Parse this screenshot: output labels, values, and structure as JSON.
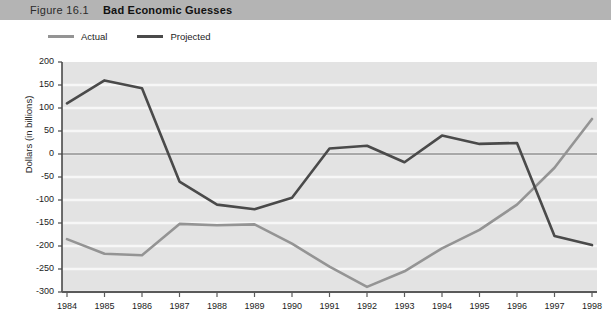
{
  "header": {
    "figure_number": "Figure 16.1",
    "title": "Bad Economic Guesses"
  },
  "legend": {
    "position": "top-left",
    "items": [
      {
        "label": "Actual",
        "color": "#949494",
        "icon": "line-swatch"
      },
      {
        "label": "Projected",
        "color": "#4a4a4a",
        "icon": "line-swatch"
      }
    ]
  },
  "chart_data": {
    "type": "line",
    "title": "Bad Economic Guesses",
    "xlabel": "",
    "ylabel": "Dollars (in billions)",
    "x": [
      1984,
      1985,
      1986,
      1987,
      1988,
      1989,
      1990,
      1991,
      1992,
      1993,
      1994,
      1995,
      1996,
      1997,
      1998
    ],
    "xticklabels": [
      "1984",
      "1985",
      "1986",
      "1987",
      "1988",
      "1989",
      "1990",
      "1991",
      "1992",
      "1993",
      "1994",
      "1995",
      "1996",
      "1997",
      "1998"
    ],
    "yticks": [
      -300,
      -250,
      -200,
      -150,
      -100,
      -50,
      0,
      50,
      100,
      150,
      200
    ],
    "yticklabels": [
      "-300",
      "-250",
      "-200",
      "-150",
      "-100",
      "-50",
      "0",
      "50",
      "100",
      "150",
      "200"
    ],
    "ylim": [
      -300,
      200
    ],
    "xlim": [
      1984,
      1998
    ],
    "grid": true,
    "grid_orientation": "horizontal",
    "zero_line": true,
    "plot_background": "#e3e3e3",
    "grid_color": "#f7f7f7",
    "series": [
      {
        "name": "Actual",
        "color": "#949494",
        "values": [
          -185,
          -217,
          -220,
          -152,
          -155,
          -153,
          -195,
          -245,
          -289,
          -255,
          -205,
          -165,
          -110,
          -30,
          76
        ]
      },
      {
        "name": "Projected",
        "color": "#4a4a4a",
        "values": [
          110,
          160,
          143,
          -60,
          -110,
          -120,
          -95,
          12,
          18,
          -18,
          40,
          22,
          24,
          -178,
          -198
        ]
      }
    ]
  }
}
